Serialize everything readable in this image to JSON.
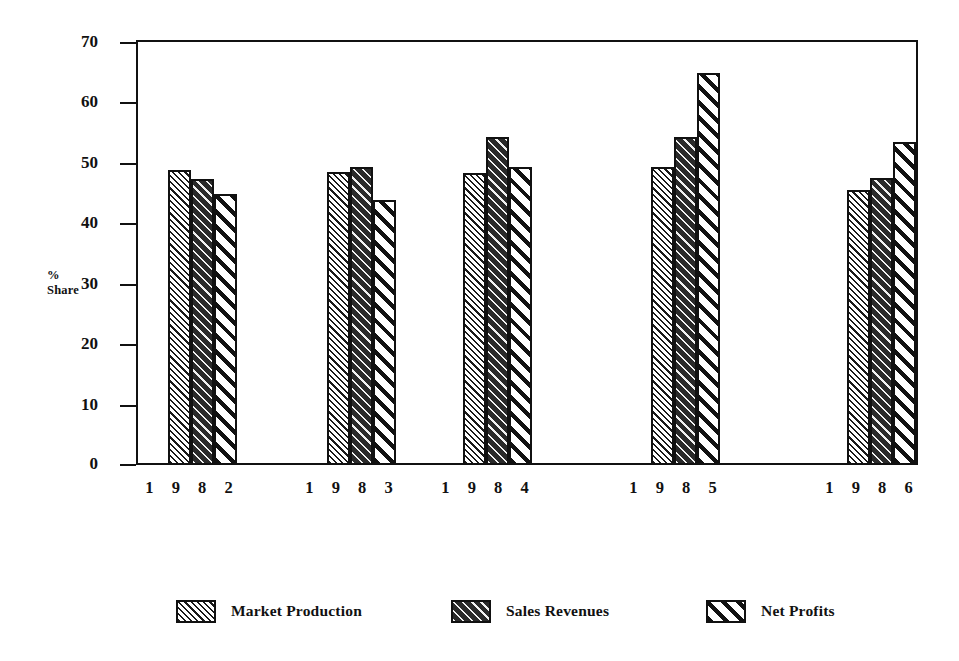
{
  "chart_data": {
    "type": "bar",
    "title": "",
    "subtitle": "",
    "xlabel": "",
    "ylabel": "%\nShare",
    "ylabel_lines": [
      "%",
      "Share"
    ],
    "categories": [
      "1 9 8 2",
      "1 9 8 3",
      "1 9 8 4",
      "1 9 8 5",
      "1 9 8 6"
    ],
    "category_values": [
      "1982",
      "1983",
      "1984",
      "1985",
      "1986"
    ],
    "series": [
      {
        "name": "Market Production",
        "pattern": "dense-fine-hatch",
        "values": [
          48.8,
          48.5,
          48.3,
          49.3,
          45.5
        ]
      },
      {
        "name": "Sales Revenues",
        "pattern": "dark-thin-diagonal",
        "values": [
          47.4,
          49.3,
          54.2,
          54.3,
          47.5
        ]
      },
      {
        "name": "Net Profits",
        "pattern": "bold-black-diagonal",
        "values": [
          44.9,
          43.9,
          49.3,
          64.8,
          53.5
        ]
      }
    ],
    "ylim": [
      0,
      70
    ],
    "yticks": [
      0,
      10,
      20,
      30,
      40,
      50,
      60,
      70
    ],
    "ytick_labels": [
      "0",
      "10",
      "20",
      "30",
      "40",
      "50",
      "60",
      "70"
    ],
    "grid": false,
    "legend_position": "bottom",
    "colors": {
      "ink": "#111111",
      "background": "#ffffff",
      "series_dark_fill": "#2a2a2a"
    }
  },
  "legend": {
    "items": [
      {
        "label": "Market Production",
        "swatch": "pat-a"
      },
      {
        "label": "Sales Revenues",
        "swatch": "pat-b"
      },
      {
        "label": "Net Profits",
        "swatch": "pat-c"
      }
    ]
  }
}
